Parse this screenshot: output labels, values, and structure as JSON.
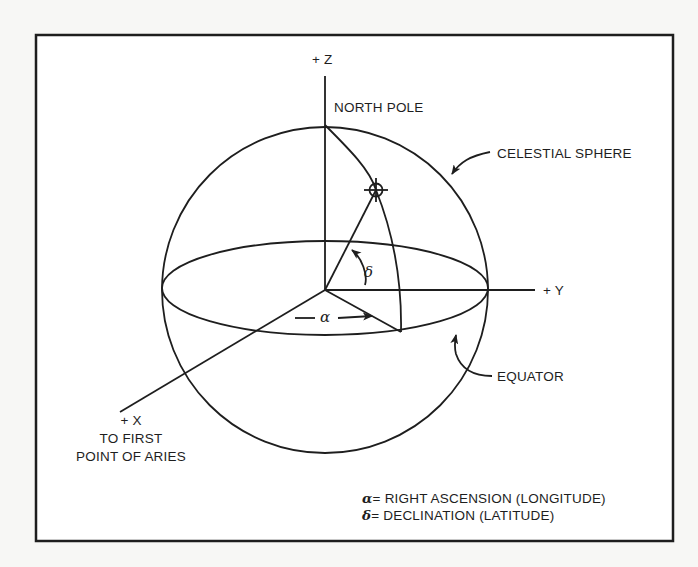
{
  "figure": {
    "type": "celestial-sphere-diagram",
    "colors": {
      "line": "#1e1e1e",
      "background": "#ffffff",
      "page": "#f7f7f5"
    }
  },
  "axes": {
    "z_label": "+ Z",
    "y_label": "+ Y",
    "x_label": "+ X",
    "x_sublabel_line1": "TO FIRST",
    "x_sublabel_line2": "POINT OF ARIES"
  },
  "labels": {
    "north_pole": "NORTH POLE",
    "celestial_sphere": "CELESTIAL SPHERE",
    "equator": "EQUATOR",
    "alpha_symbol": "α",
    "delta_symbol": "δ"
  },
  "legend": {
    "items": [
      {
        "symbol": "α",
        "text": "= RIGHT ASCENSION (LONGITUDE)"
      },
      {
        "symbol": "δ",
        "text": "= DECLINATION (LATITUDE)"
      }
    ]
  },
  "markers": {
    "star_icon": "crosshair-circle"
  }
}
